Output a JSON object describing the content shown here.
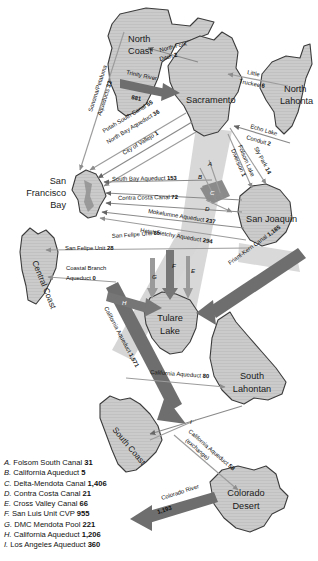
{
  "map": {
    "title": "California Water Transfers Map",
    "regions": [
      {
        "id": "north-coast",
        "label": "North Coast",
        "lines": [
          "North",
          "Coast"
        ]
      },
      {
        "id": "sacramento",
        "label": "Sacramento",
        "lines": [
          "Sacramento"
        ]
      },
      {
        "id": "north-lahontan",
        "label": "North Lahontan",
        "lines": [
          "North",
          "Lahonta"
        ]
      },
      {
        "id": "san-francisco-bay",
        "label": "San Francisco Bay",
        "lines": [
          "San",
          "Francisco",
          "Bay"
        ]
      },
      {
        "id": "san-joaquin",
        "label": "San Joaquin",
        "lines": [
          "San Joaquin"
        ]
      },
      {
        "id": "central-coast",
        "label": "Central Coast",
        "lines": [
          "Central Coast"
        ]
      },
      {
        "id": "tulare-lake",
        "label": "Tulare Lake",
        "lines": [
          "Tulare",
          "Lake"
        ]
      },
      {
        "id": "south-lahontan",
        "label": "South Lahontan",
        "lines": [
          "South",
          "Lahontan"
        ]
      },
      {
        "id": "south-coast",
        "label": "South Coast",
        "lines": [
          "South Coast"
        ]
      },
      {
        "id": "colorado-desert",
        "label": "Colorado Desert",
        "lines": [
          "Colorado",
          "Desert"
        ]
      }
    ],
    "flows": [
      {
        "id": "sonoma-petaluma",
        "name": "Sonoma/Petaluma Aqueducts",
        "value": "33"
      },
      {
        "id": "north-fork-ditch",
        "name": "North Fork Ditch",
        "value": "2"
      },
      {
        "id": "trinity-river",
        "name": "Trinity River",
        "value": "881"
      },
      {
        "id": "little-truckee",
        "name": "Little Truckee",
        "value": "6"
      },
      {
        "id": "echo-lake-conduit",
        "name": "Echo Lake Conduit",
        "value": "2"
      },
      {
        "id": "sly-park",
        "name": "Sly Park",
        "value": "14"
      },
      {
        "id": "folsom-lake-diversion",
        "name": "Folsom Lake Diversion",
        "value": "1"
      },
      {
        "id": "putah-south-canal",
        "name": "Putah South Canal",
        "value": "55"
      },
      {
        "id": "north-bay-aqueduct",
        "name": "North Bay Aqueduct",
        "value": "36"
      },
      {
        "id": "city-of-vallejo",
        "name": "City of Vallejo",
        "value": "1"
      },
      {
        "id": "south-bay-aqueduct",
        "name": "South Bay Aqueduct",
        "value": "153"
      },
      {
        "id": "contra-costa-canal",
        "name": "Contra Costa Canal",
        "value": "72"
      },
      {
        "id": "mokelumne-aqueduct",
        "name": "Mokelumne Aqueduct",
        "value": "237"
      },
      {
        "id": "hetch-hetchy-aqueduct",
        "name": "Hetch Hetchy Aqueduct",
        "value": "294"
      },
      {
        "id": "san-felipe-unit-85",
        "name": "San Felipe Unit",
        "value": "85"
      },
      {
        "id": "san-felipe-unit-28",
        "name": "San Felipe Unit",
        "value": "28"
      },
      {
        "id": "coastal-branch-aqueduct",
        "name": "Coastal Branch Aqueduct",
        "value": "0"
      },
      {
        "id": "friant-kern-canal",
        "name": "Friant-Kern Canal",
        "value": "1,185"
      },
      {
        "id": "california-aqueduct-1571",
        "name": "California Aqueduct",
        "value": "1,571"
      },
      {
        "id": "california-aqueduct-80",
        "name": "California Aqueduct",
        "value": "80"
      },
      {
        "id": "california-aqueduct-exchange",
        "name": "California Aqueduct (exchange)",
        "value": "58"
      },
      {
        "id": "colorado-river",
        "name": "Colorado River",
        "value": "1,193"
      }
    ],
    "keyed_arrows": [
      {
        "key": "A"
      },
      {
        "key": "B"
      },
      {
        "key": "C"
      },
      {
        "key": "D"
      },
      {
        "key": "E"
      },
      {
        "key": "F"
      },
      {
        "key": "G"
      },
      {
        "key": "H"
      },
      {
        "key": "I"
      }
    ],
    "arrow_text": {
      "sonoma_petaluma_l1": "Sonoma/Petaluma",
      "sonoma_petaluma_l2": "Aqueducts",
      "sonoma_petaluma_v": "33",
      "north_fork_l1": "North Fork",
      "north_fork_l2": "Ditch",
      "north_fork_v": "2",
      "trinity_l1": "Trinity River",
      "trinity_v": "881",
      "little_truckee_l1": "Little",
      "little_truckee_l2": "Truckee",
      "little_truckee_v": "6",
      "echo_l1": "Echo Lake",
      "echo_l2": "Conduit",
      "echo_v": "2",
      "sly_l1": "Sly Park",
      "sly_v": "14",
      "folsom_l1": "Folsom Lake",
      "folsom_l2": "Diversion",
      "folsom_v": "1",
      "putah": "Putah South Canal",
      "putah_v": "55",
      "nba": "North Bay Aqueduct",
      "nba_v": "36",
      "vallejo": "City of Vallejo",
      "vallejo_v": "1",
      "sba": "South Bay Aqueduct",
      "sba_v": "153",
      "ccc": "Contra Costa Canal",
      "ccc_v": "72",
      "moke": "Mokelumne Aqueduct",
      "moke_v": "237",
      "hetch": "Hetch Hetchy Aqueduct",
      "hetch_v": "294",
      "sfu85": "San Felipe Unit",
      "sfu85_v": "85",
      "sfu28": "San Felipe Unit",
      "sfu28_v": "28",
      "coastal_l1": "Coastal Branch",
      "coastal_l2": "Aqueduct",
      "coastal_v": "0",
      "friant": "Friant-Kern Canal",
      "friant_v": "1,185",
      "ca1571": "California Aqueduct",
      "ca1571_v": "1,571",
      "ca80": "California Aqueduct",
      "ca80_v": "80",
      "caex_l1": "California Aqueduct",
      "caex_l2": "(exchange)",
      "caex_v": "58",
      "colorado_l1": "Colorado River",
      "colorado_v": "1,193"
    }
  },
  "legend": {
    "items": [
      {
        "key": "A.",
        "name": "Folsom South Canal",
        "value": "31"
      },
      {
        "key": "B.",
        "name": "California Aqueduct",
        "value": "5"
      },
      {
        "key": "C.",
        "name": "Delta-Mendota Canal",
        "value": "1,406"
      },
      {
        "key": "D.",
        "name": "Contra Costa Canal",
        "value": "21"
      },
      {
        "key": "E.",
        "name": "Cross Valley Canal",
        "value": "66"
      },
      {
        "key": "F.",
        "name": "San Luis Unit CVP",
        "value": "955"
      },
      {
        "key": "G.",
        "name": "DMC Mendota Pool",
        "value": "221"
      },
      {
        "key": "H.",
        "name": "California Aqueduct",
        "value": "1,206"
      },
      {
        "key": "I.",
        "name": "Los Angeles Aqueduct",
        "value": "360"
      }
    ]
  },
  "colors": {
    "region_fill": "#c9c9c9",
    "region_stroke": "#3a3a3a",
    "arrow_dark": "#5c5c5c",
    "arrow_light": "#cfcfcf",
    "text": "#1a1a1a",
    "background": "#ffffff"
  }
}
